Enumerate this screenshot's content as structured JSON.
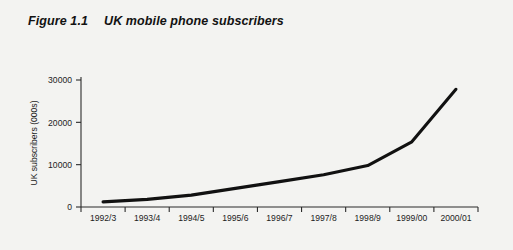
{
  "figure": {
    "number": "Figure 1.1",
    "title": "UK mobile phone subscribers"
  },
  "colors": {
    "background": "#f3f3f1",
    "line": "#111111",
    "axis": "#2b2b2b",
    "text": "#1d1d1d"
  },
  "chart_data": {
    "type": "line",
    "title": "UK mobile phone subscribers",
    "xlabel": "",
    "ylabel": "UK subscribers (000s)",
    "categories": [
      "1992/3",
      "1993/4",
      "1994/5",
      "1995/6",
      "1996/7",
      "1997/8",
      "1998/9",
      "1999/00",
      "2000/01"
    ],
    "values": [
      1200,
      1800,
      2800,
      4400,
      6000,
      7600,
      9800,
      15400,
      27800
    ],
    "series": [
      {
        "name": "UK mobile phone subscribers",
        "values": [
          1200,
          1800,
          2800,
          4400,
          6000,
          7600,
          9800,
          15400,
          27800
        ]
      }
    ],
    "ylim": [
      0,
      30000
    ],
    "yticks": [
      0,
      10000,
      20000,
      30000
    ],
    "yticklabels": [
      "0",
      "10000",
      "20000",
      "30000"
    ],
    "grid": false,
    "legend": false
  }
}
